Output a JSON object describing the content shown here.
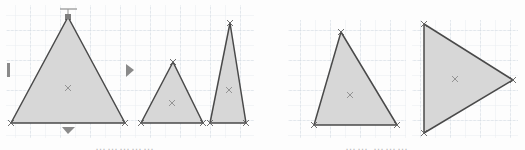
{
  "figure": {
    "background_color": "#fdfdfd",
    "grid": {
      "color": "#c9d2dc",
      "minor_color": "#e2e7ec",
      "spacing_px": 15,
      "style": "dashed",
      "visible": true
    },
    "shape_style": {
      "fill_color": "#d7d7d7",
      "stroke_color": "#4a4a4a",
      "stroke_width": 1.4,
      "centroid_marker": "x",
      "centroid_marker_color": "#8c8c8c",
      "vertex_marker": "x",
      "vertex_marker_color": "#6b6b6b"
    },
    "panels": [
      {
        "id": "panel-left",
        "name": "left-panel",
        "caption": "……………",
        "grid_rect": {
          "x": 6,
          "y": 5,
          "width": 248,
          "height": 133
        },
        "shapes": [
          {
            "id": "triangle-1",
            "name": "large-triangle",
            "label": "Triangle 1",
            "type": "triangle",
            "points": "11,123 68,17 125,123",
            "centroid": {
              "x": 68,
              "y": 88
            },
            "centroid_label": "x"
          },
          {
            "id": "triangle-2",
            "name": "medium-triangle",
            "label": "Triangle 2",
            "type": "triangle",
            "points": "141,123 173,62 203,123",
            "centroid": {
              "x": 172,
              "y": 103
            },
            "centroid_label": "x"
          },
          {
            "id": "triangle-3",
            "name": "tall-narrow-triangle",
            "label": "Triangle 3",
            "type": "triangle",
            "points": "210,123 230,23 246,123",
            "centroid": {
              "x": 229,
              "y": 90
            },
            "centroid_label": "x"
          }
        ],
        "handles": [
          {
            "id": "handle-top",
            "name": "top-resize-handle",
            "glyph": "T-bar",
            "x": 68,
            "y": 12,
            "orientation": "up"
          },
          {
            "id": "handle-bottom",
            "name": "bottom-arrow-handle",
            "glyph": "triangle-down",
            "x": 68,
            "y": 130,
            "orientation": "down"
          },
          {
            "id": "handle-left",
            "name": "left-bar-handle",
            "glyph": "vertical-bar",
            "x": 9,
            "y": 70,
            "orientation": "left"
          },
          {
            "id": "handle-right",
            "name": "right-arrow-handle",
            "glyph": "triangle-right",
            "x": 130,
            "y": 70,
            "orientation": "right"
          }
        ]
      },
      {
        "id": "panel-right",
        "name": "right-panel",
        "caption": "…… ………",
        "grid_rect": {
          "x": 288,
          "y": 20,
          "width": 230,
          "height": 118
        },
        "shapes": [
          {
            "id": "triangle-4",
            "name": "upright-triangle",
            "label": "Triangle 4",
            "type": "triangle",
            "points": "314,125 341,32 397,125",
            "centroid": {
              "x": 350,
              "y": 95
            },
            "centroid_label": "x"
          },
          {
            "id": "triangle-5",
            "name": "rotated-triangle",
            "label": "Triangle 5",
            "type": "triangle",
            "points": "424,24 513,80 424,133",
            "centroid": {
              "x": 455,
              "y": 79
            },
            "centroid_label": "x"
          }
        ],
        "handles": []
      }
    ]
  }
}
